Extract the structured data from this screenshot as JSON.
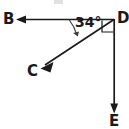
{
  "figure": {
    "kind": "geometry-ray-diagram",
    "background_color": "#ffffff",
    "stroke_color": "#1a1a1a",
    "label_color": "#1a1a1a",
    "canvas": {
      "width": 129,
      "height": 129
    }
  },
  "labels": {
    "B": "B",
    "C": "C",
    "D": "D",
    "E": "E",
    "angle_BDC": "34°"
  },
  "icon_names": {
    "arrowhead_b": "arrowhead-left-icon",
    "arrowhead_c": "arrowhead-down-left-icon",
    "arrowhead_e": "arrowhead-down-icon",
    "right_angle": "right-angle-square-icon",
    "angle_arc": "angle-arc-icon"
  },
  "geometry": {
    "vertex_D": {
      "x": 114,
      "y": 19
    },
    "ray_DB": {
      "from": {
        "x": 114,
        "y": 19
      },
      "to": {
        "x": 16,
        "y": 19
      },
      "label": "B",
      "direction": "left",
      "arrow": true
    },
    "ray_DC": {
      "from": {
        "x": 114,
        "y": 19
      },
      "to": {
        "x": 41,
        "y": 68
      },
      "label": "C",
      "direction": "down-left",
      "arrow": true
    },
    "ray_DE": {
      "from": {
        "x": 114,
        "y": 19
      },
      "to": {
        "x": 114,
        "y": 113
      },
      "label": "E",
      "direction": "down",
      "arrow": true
    },
    "angle_arc_BDC": {
      "center": {
        "x": 114,
        "y": 19
      },
      "radius": 45,
      "start_deg": 180,
      "end_deg": 146,
      "measure": "34°"
    },
    "right_angle_marker_CDE": {
      "x": 102,
      "y": 20,
      "size": 12,
      "between": [
        "ray_DC",
        "ray_DE"
      ]
    }
  },
  "measurements": {
    "angle_BDC_degrees": 34,
    "angle_CDE_degrees": 90,
    "angle_BDE_degrees": 124
  }
}
